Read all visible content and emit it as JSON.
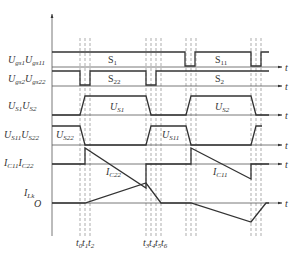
{
  "diagram": {
    "type": "timing-waveform",
    "time_axis_label": "t",
    "time_marks_group1": [
      "t0",
      "t1",
      "t2"
    ],
    "time_marks_group2": [
      "t3",
      "t4",
      "t5",
      "t6"
    ],
    "origin_label": "O",
    "rows": [
      {
        "id": "ugs1",
        "label_main": "U",
        "label_sub": "gs1",
        "label_main2": "U",
        "label_sub2": "gs11",
        "annotations": [
          {
            "main": "S",
            "sub": "1"
          },
          {
            "main": "S",
            "sub": "11"
          }
        ]
      },
      {
        "id": "ugs2",
        "label_main": "U",
        "label_sub": "gs2",
        "label_main2": "U",
        "label_sub2": "gs22",
        "annotations": [
          {
            "main": "S",
            "sub": "22"
          },
          {
            "main": "S",
            "sub": "2"
          }
        ]
      },
      {
        "id": "us",
        "label_main": "U",
        "label_sub": "S1",
        "label_main2": "U",
        "label_sub2": "S2",
        "annotations": [
          {
            "main": "U",
            "sub": "S1"
          },
          {
            "main": "U",
            "sub": "S2"
          }
        ]
      },
      {
        "id": "us11",
        "label_main": "U",
        "label_sub": "S11",
        "label_main2": "U",
        "label_sub2": "S22",
        "annotations": [
          {
            "main": "U",
            "sub": "S22"
          },
          {
            "main": "U",
            "sub": "S11"
          }
        ]
      },
      {
        "id": "ic",
        "label_main": "I",
        "label_sub": "C11",
        "label_main2": "I",
        "label_sub2": "C22",
        "annotations": [
          {
            "main": "I",
            "sub": "C22"
          },
          {
            "main": "I",
            "sub": "C11"
          }
        ]
      },
      {
        "id": "ilk",
        "label_main": "I",
        "label_sub": "Lk",
        "annotations": []
      }
    ]
  }
}
